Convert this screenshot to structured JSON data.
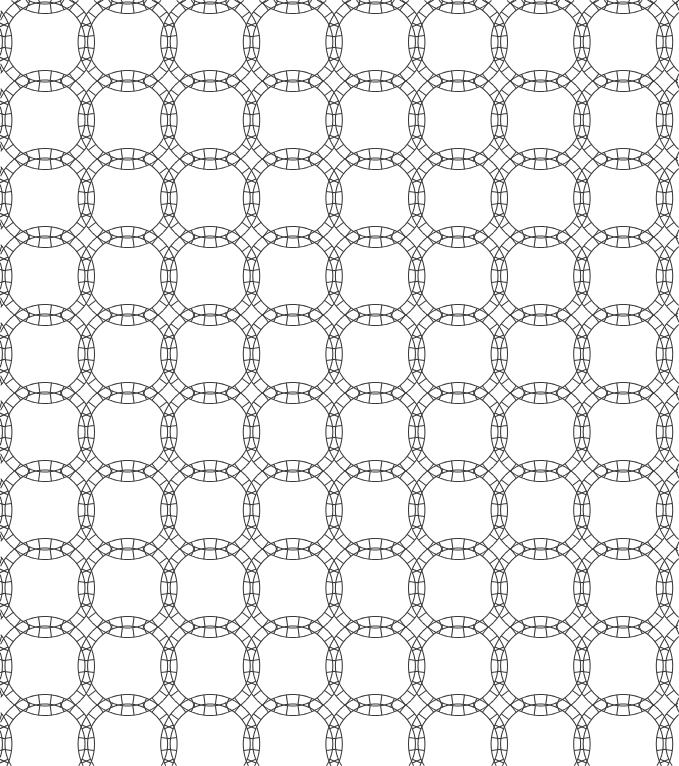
{
  "document": {
    "title": "Double Wedding Ring Quilt Pattern",
    "kind": "geometric-line-drawing",
    "width": 679,
    "height": 766,
    "background_color": "#ffffff"
  },
  "pattern": {
    "name": "double-wedding-ring",
    "description": "Grid of overlapping circular bands; each band is an annulus subdivided into segments by radial tick lines, producing pointed-oval lens shapes where neighbouring rings cross.",
    "stroke_color": "#3a3a3a",
    "stroke_width": 1.05,
    "fill_color": "none",
    "grid": {
      "columns": 8,
      "rows": 9,
      "pitch_x": 82.6,
      "pitch_y": 78.0,
      "origin_x": 45.0,
      "origin_y": 42.0
    },
    "ring": {
      "outer_radius": 49.5,
      "inner_radius": 40.0,
      "band_width": 9.5,
      "segments_per_ring": 24,
      "tick_count": 24
    },
    "clip": {
      "left": 0,
      "top": 0,
      "right": 679,
      "bottom": 766
    }
  }
}
